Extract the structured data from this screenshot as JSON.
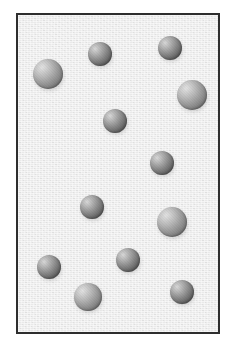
{
  "figure": {
    "particle_count": 12,
    "canvas": {
      "width": 235,
      "height": 352,
      "background_color": "#ffffff"
    },
    "container": {
      "x": 16,
      "y": 13,
      "width": 204,
      "height": 321,
      "border_color": "#2e2e2e",
      "border_width": 2,
      "fill_color": "#e9e9e9"
    },
    "particle_style": {
      "highlight_color": "#d8d8d8",
      "mid_color": "#9a9a9a",
      "shade_color": "#5d5d5d",
      "edge_color": "#4a4a4a",
      "highlight_offset": "30% 28%"
    }
  },
  "particles": [
    {
      "id": "particle-1",
      "label": "particle 1",
      "cx": 100,
      "cy": 54,
      "r": 12,
      "tone": "dark"
    },
    {
      "id": "particle-2",
      "label": "particle 2",
      "cx": 170,
      "cy": 48,
      "r": 12,
      "tone": "dark"
    },
    {
      "id": "particle-3",
      "label": "particle 3",
      "cx": 48,
      "cy": 74,
      "r": 15,
      "tone": "light"
    },
    {
      "id": "particle-4",
      "label": "particle 4",
      "cx": 192,
      "cy": 95,
      "r": 15,
      "tone": "light"
    },
    {
      "id": "particle-5",
      "label": "particle 5",
      "cx": 115,
      "cy": 121,
      "r": 12,
      "tone": "dark"
    },
    {
      "id": "particle-6",
      "label": "particle 6",
      "cx": 162,
      "cy": 163,
      "r": 12,
      "tone": "dark"
    },
    {
      "id": "particle-7",
      "label": "particle 7",
      "cx": 92,
      "cy": 207,
      "r": 12,
      "tone": "dark"
    },
    {
      "id": "particle-8",
      "label": "particle 8",
      "cx": 172,
      "cy": 222,
      "r": 15,
      "tone": "light"
    },
    {
      "id": "particle-9",
      "label": "particle 9",
      "cx": 128,
      "cy": 260,
      "r": 12,
      "tone": "dark"
    },
    {
      "id": "particle-10",
      "label": "particle 10",
      "cx": 49,
      "cy": 267,
      "r": 12,
      "tone": "dark"
    },
    {
      "id": "particle-11",
      "label": "particle 11",
      "cx": 88,
      "cy": 297,
      "r": 14,
      "tone": "light"
    },
    {
      "id": "particle-12",
      "label": "particle 12",
      "cx": 182,
      "cy": 292,
      "r": 12,
      "tone": "dark"
    }
  ]
}
